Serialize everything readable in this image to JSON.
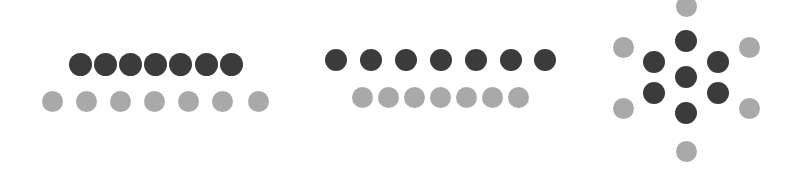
{
  "figure": {
    "width": 800,
    "height": 173,
    "background": "#ffffff",
    "colors": {
      "dark": "#3b3b3b",
      "light": "#a9a9a9"
    },
    "groups": [
      {
        "name": "group-left-spread-light-row",
        "dark": {
          "radius": 11.5,
          "points": [
            [
              80,
              64
            ],
            [
              105,
              64
            ],
            [
              130,
              64
            ],
            [
              155,
              64
            ],
            [
              180,
              64
            ],
            [
              206,
              64
            ],
            [
              231,
              64
            ]
          ]
        },
        "light": {
          "radius": 10.5,
          "points": [
            [
              52,
              101
            ],
            [
              86,
              101
            ],
            [
              120,
              101
            ],
            [
              154,
              101
            ],
            [
              188,
              101
            ],
            [
              222,
              101
            ],
            [
              258,
              101
            ]
          ]
        }
      },
      {
        "name": "group-middle-compressed-light-row",
        "dark": {
          "radius": 11,
          "points": [
            [
              336,
              60
            ],
            [
              371,
              60
            ],
            [
              406,
              60
            ],
            [
              441,
              60
            ],
            [
              476,
              60
            ],
            [
              511,
              60
            ],
            [
              545,
              60
            ]
          ]
        },
        "light": {
          "radius": 10.5,
          "points": [
            [
              362,
              97
            ],
            [
              388,
              97
            ],
            [
              414,
              97
            ],
            [
              440,
              97
            ],
            [
              466,
              97
            ],
            [
              492,
              97
            ],
            [
              518,
              97
            ]
          ]
        }
      },
      {
        "name": "group-right-radial",
        "dark": {
          "radius": 11,
          "points": [
            [
              686,
              41
            ],
            [
              654,
              62
            ],
            [
              718,
              62
            ],
            [
              686,
              77
            ],
            [
              654,
              93
            ],
            [
              718,
              93
            ],
            [
              686,
              113
            ]
          ]
        },
        "light": {
          "radius": 10.5,
          "points": [
            [
              686,
              6
            ],
            [
              623,
              47
            ],
            [
              749,
              47
            ],
            [
              623,
              108
            ],
            [
              749,
              108
            ],
            [
              686,
              151
            ]
          ]
        }
      }
    ]
  }
}
